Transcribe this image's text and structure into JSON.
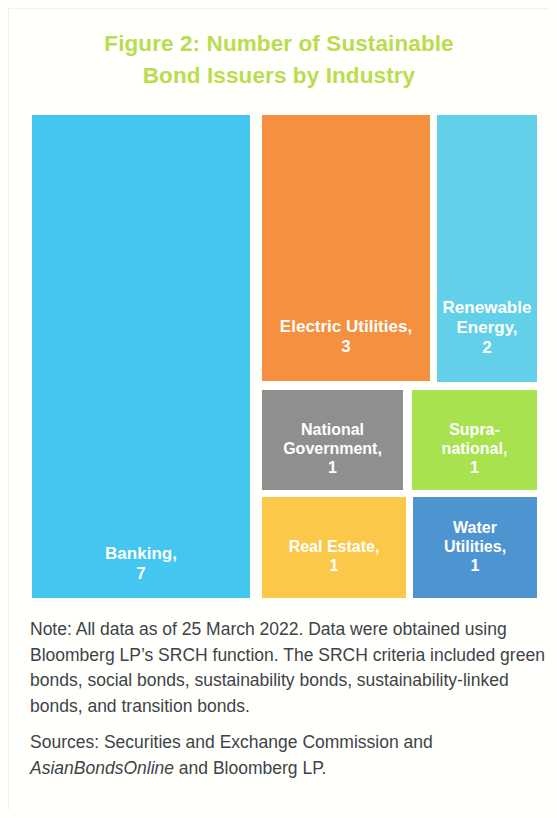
{
  "figure": {
    "title": "Figure 2: Number of Sustainable Bond Issuers by Industry",
    "title_line1": "Figure 2: Number of Sustainable",
    "title_line2": "Bond Issuers by Industry",
    "title_color": "#b9dd4e"
  },
  "chart_data": {
    "type": "treemap",
    "title": "Figure 2: Number of Sustainable Bond Issuers by Industry",
    "xlabel": "",
    "ylabel": "",
    "legend": "none",
    "grid": false,
    "value_unit": "issuers",
    "total": 16,
    "categories": [
      "Banking",
      "Electric Utilities",
      "Renewable Energy",
      "National Government",
      "Supra-national",
      "Real Estate",
      "Water Utilities"
    ],
    "values": [
      7,
      3,
      2,
      1,
      1,
      1,
      1
    ],
    "tiles": [
      {
        "label": "Banking,",
        "label_plain": "Banking",
        "value": "7",
        "color": "#43c6ef",
        "text_color": "#ffffff"
      },
      {
        "label": "Electric Utilities,",
        "label_plain": "Electric Utilities",
        "value": "3",
        "color": "#f4903e",
        "text_color": "#ffffff"
      },
      {
        "label": "Renewable\nEnergy,",
        "label_plain": "Renewable Energy",
        "value": "2",
        "color": "#62d0e8",
        "text_color": "#ffffff"
      },
      {
        "label": "National\nGovernment,",
        "label_plain": "National Government",
        "value": "1",
        "color": "#8f8f8f",
        "text_color": "#ffffff"
      },
      {
        "label": "Supra-\nnational,",
        "label_plain": "Supra-national",
        "value": "1",
        "color": "#a8e24e",
        "text_color": "#ffffff"
      },
      {
        "label": "Real Estate,",
        "label_plain": "Real Estate",
        "value": "1",
        "color": "#fbc849",
        "text_color": "#ffffff"
      },
      {
        "label": "Water\nUtilities,",
        "label_plain": "Water Utilities",
        "value": "1",
        "color": "#4e94d0",
        "text_color": "#ffffff"
      }
    ]
  },
  "footnotes": {
    "note": "Note: All data as of 25 March 2022. Data were obtained using Bloomberg LP’s SRCH function. The SRCH criteria included green bonds, social bonds, sustainability bonds, sustainability-linked bonds, and transition bonds.",
    "sources_prefix": "Sources: Securities and Exchange Commission and ",
    "sources_italic": "AsianBondsOnline",
    "sources_suffix": " and Bloomberg LP."
  }
}
